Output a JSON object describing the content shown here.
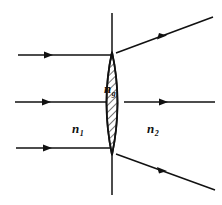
{
  "figure": {
    "name": "refraction-through-converging-lens",
    "type": "optical-ray-diagram",
    "background_color": "#ffffff",
    "stroke_color": "#111111"
  },
  "labels": {
    "medium_left": {
      "symbol": "n",
      "subscript": "1",
      "x": 72,
      "y": 133
    },
    "medium_right": {
      "symbol": "n",
      "subscript": "2",
      "x": 147,
      "y": 133
    },
    "lens_material": {
      "symbol": "n",
      "subscript": "g",
      "x": 104,
      "y": 93
    }
  },
  "lens": {
    "name": "biconvex-lens",
    "center_x": 112,
    "top_vertex_y": 52,
    "bottom_vertex_y": 155,
    "half_width": 11,
    "hatched": true,
    "hatch_angle_deg": 45,
    "hatch_spacing": 5
  },
  "optical_axis": {
    "name": "vertical-axis-line",
    "x": 112,
    "y_top": 13,
    "y_bottom": 195
  },
  "rays": [
    {
      "name": "top-incident-ray",
      "side": "incident",
      "x1": 18,
      "y1": 55,
      "x2": 112,
      "y2": 55,
      "arrow_at": 0.33
    },
    {
      "name": "middle-incident-ray",
      "side": "incident",
      "x1": 15,
      "y1": 102,
      "x2": 112,
      "y2": 102,
      "arrow_at": 0.35
    },
    {
      "name": "bottom-incident-ray",
      "side": "incident",
      "x1": 16,
      "y1": 148,
      "x2": 112,
      "y2": 148,
      "arrow_at": 0.35
    },
    {
      "name": "top-refracted-ray",
      "side": "refracted",
      "x1": 116,
      "y1": 53,
      "x2": 213,
      "y2": 17,
      "arrow_at": 0.5
    },
    {
      "name": "middle-refracted-ray",
      "side": "refracted",
      "x1": 124,
      "y1": 102,
      "x2": 215,
      "y2": 102,
      "arrow_at": 0.5
    },
    {
      "name": "bottom-refracted-ray",
      "side": "refracted",
      "x1": 116,
      "y1": 154,
      "x2": 215,
      "y2": 190,
      "arrow_at": 0.5
    }
  ]
}
